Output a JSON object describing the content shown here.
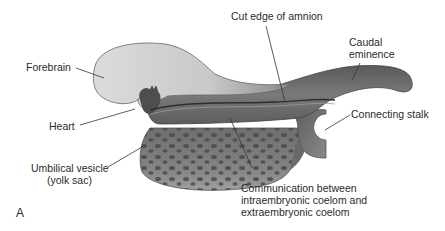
{
  "figure": {
    "panel_letter": "A",
    "labels": {
      "cut_edge_of_amnion": "Cut edge of amnion",
      "forebrain": "Forebrain",
      "caudal_eminence_line1": "Caudal",
      "caudal_eminence_line2": "eminence",
      "heart": "Heart",
      "connecting_stalk": "Connecting stalk",
      "umbilical_vesicle_line1": "Umbilical vesicle",
      "umbilical_vesicle_line2": "(yolk sac)",
      "communication_line1": "Communication between",
      "communication_line2": "intraembryonic coelom and",
      "communication_line3": "extraembryonic coelom"
    },
    "colors": {
      "forebrain_fill": "#d2d2d2",
      "body_dark": "#6a6a6a",
      "yolk_sac": "#7a7a7a",
      "yolk_spots": "#4a4a4a",
      "leader_line": "#333333"
    }
  }
}
